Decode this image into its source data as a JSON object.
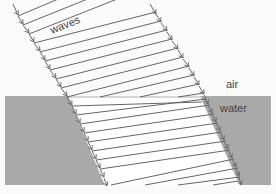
{
  "diagram": {
    "labels": {
      "waves": "waves",
      "air": "air",
      "water": "water"
    },
    "colors": {
      "air": "#fbfbfb",
      "water": "#a9a9a9",
      "band": "#ffffff",
      "line": "#666666"
    },
    "interface_y": 96,
    "air_wavefront_count": 10,
    "water_wavefront_count": 10
  }
}
